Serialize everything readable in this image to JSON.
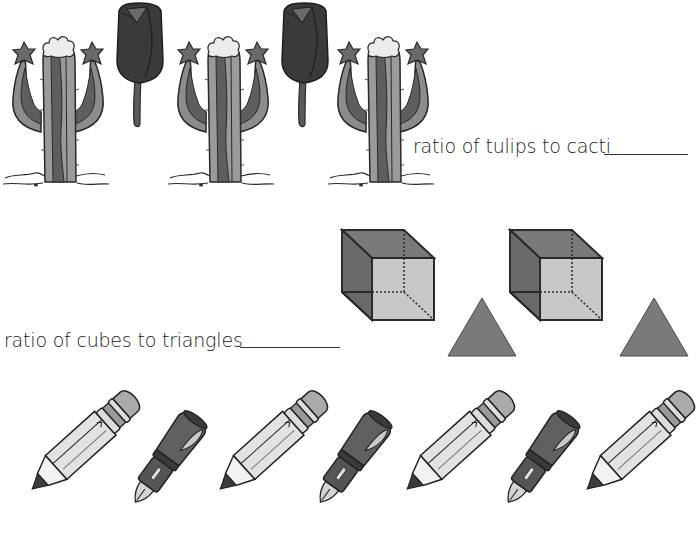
{
  "worksheet": {
    "questions": [
      {
        "id": "tulips-cacti",
        "prompt": "ratio of tulips to cacti",
        "answer": "",
        "items": [
          {
            "type": "cactus",
            "count": 3
          },
          {
            "type": "tulip",
            "count": 2
          }
        ]
      },
      {
        "id": "cubes-triangles",
        "prompt": "ratio of cubes to triangles",
        "answer": "",
        "items": [
          {
            "type": "cube",
            "count": 2
          },
          {
            "type": "triangle",
            "count": 2
          }
        ]
      },
      {
        "id": "pencils-pens",
        "prompt": "",
        "answer": "",
        "items": [
          {
            "type": "pencil",
            "count": 4
          },
          {
            "type": "fountain-pen",
            "count": 3
          }
        ]
      }
    ],
    "row1_sequence": [
      "cactus",
      "tulip",
      "cactus",
      "tulip",
      "cactus"
    ],
    "row2_sequence": [
      "cube",
      "triangle",
      "cube",
      "triangle"
    ],
    "row3_sequence": [
      "pencil",
      "fountain-pen",
      "pencil",
      "fountain-pen",
      "pencil",
      "fountain-pen",
      "pencil"
    ]
  },
  "colors": {
    "background": "#ffffff",
    "outline": "#2a2a2a",
    "cactus_light": "#9a9a9a",
    "cactus_dark": "#5e5e5e",
    "cactus_flower": "#e8e8e8",
    "tulip": "#3a3a3a",
    "cube_dark": "#6e6e6e",
    "cube_face": "#c4c4c4",
    "triangle": "#7a7a7a",
    "pencil_body": "#e6e6e6",
    "pencil_eraser": "#aaaaaa",
    "pen_body": "#555555"
  }
}
